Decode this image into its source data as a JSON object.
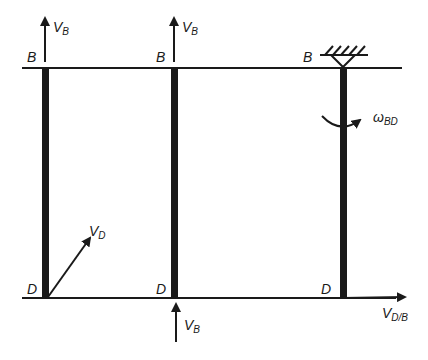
{
  "diagram": {
    "colors": {
      "ink": "#1a1a1a",
      "background": "#ffffff"
    },
    "panels": [
      {
        "id": "left",
        "top_label": "B",
        "bottom_label": "D",
        "top_arrow": {
          "base": "V",
          "sub": "B"
        },
        "diag_arrow": {
          "base": "V",
          "sub": "D"
        }
      },
      {
        "id": "middle",
        "top_label": "B",
        "bottom_label": "D",
        "top_arrow": {
          "base": "V",
          "sub": "B"
        },
        "bottom_arrow": {
          "base": "V",
          "sub": "B"
        }
      },
      {
        "id": "right",
        "top_label": "B",
        "bottom_label": "D",
        "support": "fixed-pin-icon",
        "rotation": {
          "base": "ω",
          "sub": "BD"
        },
        "bottom_arrow": {
          "base": "V",
          "sub": "D/B"
        }
      }
    ]
  }
}
